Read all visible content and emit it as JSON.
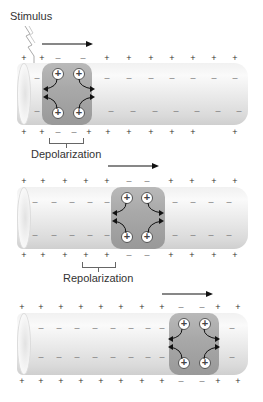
{
  "labels": {
    "stimulus": "Stimulus",
    "depolarization": "Depolarization",
    "repolarization": "Repolarization"
  },
  "symbols": {
    "plus": "+",
    "minus": "–",
    "ion": "+"
  },
  "panels": [
    {
      "id": "panel-1",
      "top_outside": [
        "+",
        "+",
        "–",
        "–",
        "+",
        "+",
        "+",
        "+",
        "+",
        "+",
        "+"
      ],
      "bottom_outside": [
        "+",
        "+",
        "–",
        "–",
        "+",
        "+",
        "+",
        "+",
        "+",
        "+",
        "+"
      ],
      "inside_note": "inside negative ahead of depolarized zone"
    },
    {
      "id": "panel-2",
      "top_outside": [
        "+",
        "+",
        "+",
        "+",
        "+",
        "–",
        "–",
        "+",
        "+",
        "+",
        "+"
      ],
      "bottom_outside": [
        "+",
        "+",
        "+",
        "+",
        "+",
        "–",
        "–",
        "+",
        "+",
        "+",
        "+"
      ]
    },
    {
      "id": "panel-3",
      "top_outside": [
        "+",
        "+",
        "+",
        "+",
        "+",
        "+",
        "+",
        "+",
        "–",
        "–",
        "+",
        "+"
      ],
      "bottom_outside": [
        "+",
        "+",
        "+",
        "+",
        "+",
        "+",
        "+",
        "+",
        "–",
        "–",
        "+",
        "+"
      ]
    }
  ],
  "colors": {
    "band": "#a9a9a9",
    "tube": "#eeeeee",
    "text": "#333333",
    "arrow": "#111111"
  }
}
